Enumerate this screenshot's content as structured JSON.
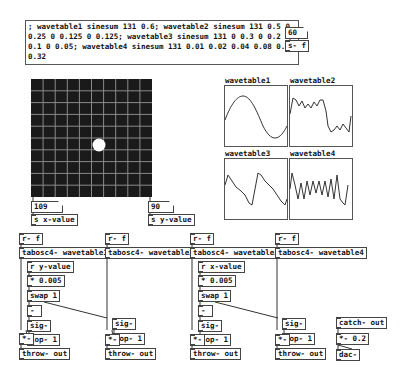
{
  "message_box": {
    "text": "; wavetable1 sinesum 131 0.6; wavetable2 sinesum 131 0.5 0 0.25 0 0.125 0 0.125; wavetable3 sinesum 131 0 0.3 0 0.2 0 0.1 0 0.05; wavetable4 sinesum 131 0.01 0.02 0.04 0.08 0.16 0.32"
  },
  "freq": {
    "value": "60",
    "send": "s- f"
  },
  "grid": {
    "x_value": "109",
    "y_value": "90",
    "send_x": "s x-value",
    "send_y": "s y-value",
    "rows": 10,
    "cols": 10
  },
  "arrays": [
    {
      "name": "wavetable1"
    },
    {
      "name": "wavetable2"
    },
    {
      "name": "wavetable3"
    },
    {
      "name": "wavetable4"
    }
  ],
  "voices": [
    {
      "recv": "r- f",
      "osc": "tabosc4- wavetable1",
      "ctrl": "r y-value",
      "mul": "* 0.005",
      "swap": "swap 1",
      "minus": "-",
      "sig": "sig-",
      "lop": "lop- 1",
      "times": "*-",
      "throw": "throw- out"
    },
    {
      "recv": "r- f",
      "osc": "tabosc4- wavetable2",
      "sig": "sig-",
      "lop": "lop- 1",
      "times": "*-",
      "throw": "throw- out"
    },
    {
      "recv": "r- f",
      "osc": "tabosc4- wavetable3",
      "ctrl": "r x-value",
      "mul": "* 0.005",
      "swap": "swap 1",
      "minus": "-",
      "sig": "sig-",
      "lop": "lop- 1",
      "times": "*-",
      "throw": "throw- out"
    },
    {
      "recv": "r- f",
      "osc": "tabosc4- wavetable4",
      "sig": "sig-",
      "lop": "lop- 1",
      "times": "*-",
      "throw": "throw- out"
    }
  ],
  "output": {
    "catch": "catch- out",
    "gain": "*- 0.2",
    "dac": "dac-"
  }
}
